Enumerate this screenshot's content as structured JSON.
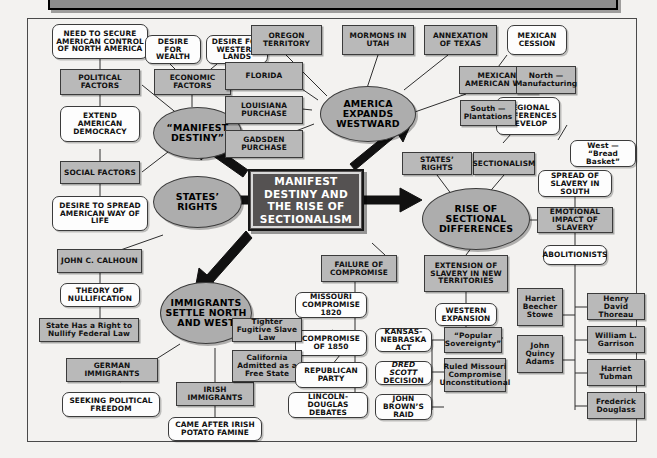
{
  "title": "MANIFEST DESTINY AND SECTIONALISM",
  "colors": {
    "page_background": "#f3f2f0",
    "box_fill": "#b9b9b9",
    "round_fill": "#fdfdfd",
    "ellipse_fill": "#adadad",
    "center_fill": "#555252",
    "center_text": "#ffffff",
    "outline": "#3b3b3b"
  },
  "center": {
    "label": "MANIFEST DESTINY AND THE RISE OF SECTIONALISM"
  },
  "hubs": [
    {
      "id": "manifest-destiny",
      "label": "“MANIFEST DESTINY”"
    },
    {
      "id": "states-rights",
      "label": "STATES’ RIGHTS"
    },
    {
      "id": "immigrants-settle",
      "label": "IMMIGRANTS SETTLE NORTH AND WEST"
    },
    {
      "id": "america-expands",
      "label": "AMERICA EXPANDS WESTWARD"
    },
    {
      "id": "rise-of-sectional-differences",
      "label": "RISE OF SECTIONAL DIFFERENCES"
    }
  ],
  "branch_manifest_destiny": {
    "political_factors": "POLITICAL FACTORS",
    "need_to_secure": "NEED TO SECURE AMERICAN CONTROL OF NORTH AMERICA",
    "extend_democracy": "EXTEND AMERICAN DEMOCRACY",
    "economic_factors": "ECONOMIC FACTORS",
    "desire_for_wealth": "DESIRE FOR WEALTH",
    "desire_western_lands": "DESIRE FOR WESTERN LANDS",
    "social_factors": "SOCIAL FACTORS",
    "desire_to_spread": "DESIRE TO SPREAD AMERICAN WAY OF LIFE"
  },
  "branch_states_rights": {
    "john_c_calhoun": "JOHN C. CALHOUN",
    "theory_of_nullification": "THEORY OF NULLIFICATION",
    "state_has_right": "State Has a Right to Nullify Federal Law"
  },
  "branch_immigrants": {
    "german_immigrants": "GERMAN IMMIGRANTS",
    "seeking_political_freedom": "SEEKING POLITICAL FREEDOM",
    "irish_immigrants": "IRISH IMMIGRANTS",
    "came_after_famine": "CAME AFTER IRISH POTATO FAMINE"
  },
  "branch_america_expands": {
    "oregon_territory": "OREGON TERRITORY",
    "florida": "FLORIDA",
    "louisiana_purchase": "LOUISIANA PURCHASE",
    "gadsden_purchase": "GADSDEN PURCHASE",
    "mormons_in_utah": "MORMONS IN UTAH",
    "annexation_of_texas": "ANNEXATION OF TEXAS",
    "mexican_american_war": "MEXICAN-AMERICAN WAR",
    "mexican_cession": "MEXICAN CESSION"
  },
  "branch_regional": {
    "regional_differences_develop": "REGIONAL DIFFERENCES DEVELOP",
    "north_manufacturing": "North — Manufacturing",
    "south_plantations": "South — Plantations",
    "west_bread_basket": "West — “Bread Basket”",
    "sectionalism": "SECTIONALISM",
    "states_rights_box": "STATES’ RIGHTS"
  },
  "branch_slavery": {
    "spread_of_slavery_in_south": "SPREAD OF SLAVERY IN SOUTH",
    "emotional_impact": "EMOTIONAL IMPACT OF SLAVERY",
    "abolitionists": "ABOLITIONISTS",
    "names": [
      "Harriet Beecher Stowe",
      "John Quincy Adams",
      "Henry David Thoreau",
      "William L. Garrison",
      "Harriet Tubman",
      "Frederick Douglass"
    ]
  },
  "branch_extension": {
    "extension_of_slavery": "EXTENSION OF SLAVERY IN NEW TERRITORIES",
    "western_expansion": "WESTERN EXPANSION",
    "kansas_nebraska_act": "KANSAS-NEBRASKA ACT",
    "popular_sovereignty": "“Popular Sovereignty”",
    "dred_scott_italic": "DRED SCOTT",
    "dred_scott_rest": "DECISION",
    "ruled_missouri": "Ruled Missouri Compromise Unconstitutional",
    "john_browns_raid": "JOHN BROWN’S RAID"
  },
  "branch_failure": {
    "failure_of_compromise": "FAILURE OF COMPROMISE",
    "missouri_compromise_1820": "MISSOURI COMPROMISE 1820",
    "compromise_of_1850": "COMPROMISE OF 1850",
    "tighter_fugitive_slave_law": "Tighter Fugitive Slave Law",
    "california_free_state": "California Admitted as a Free State",
    "republican_party": "REPUBLICAN PARTY",
    "lincoln_douglas_debates": "LINCOLN-DOUGLAS DEBATES"
  }
}
